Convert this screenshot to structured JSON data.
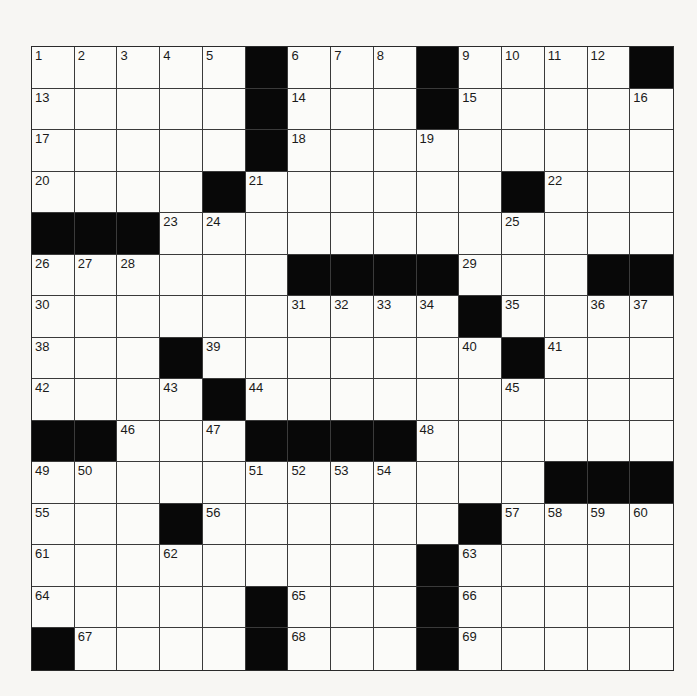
{
  "puzzle": {
    "rows": 15,
    "cols": 15,
    "colors": {
      "block": "#080808",
      "cell": "#fbfbf9",
      "line": "#3a3a3a",
      "page": "#f7f6f3"
    },
    "grid": [
      [
        "1",
        "2",
        "3",
        "4",
        "5",
        "#",
        "6",
        "7",
        "8",
        "#",
        "9",
        "10",
        "11",
        "12",
        "#"
      ],
      [
        "13",
        "",
        "",
        "",
        "",
        "#",
        "14",
        "",
        "",
        "#",
        "15",
        "",
        "",
        "",
        "16"
      ],
      [
        "17",
        "",
        "",
        "",
        "",
        "#",
        "18",
        "",
        "",
        "19",
        "",
        "",
        "",
        "",
        ""
      ],
      [
        "20",
        "",
        "",
        "",
        "#",
        "21",
        "",
        "",
        "",
        "",
        "",
        "#",
        "22",
        "",
        ""
      ],
      [
        "#",
        "#",
        "#",
        "23",
        "24",
        "",
        "",
        "",
        "",
        "",
        "",
        "25",
        "",
        "",
        ""
      ],
      [
        "26",
        "27",
        "28",
        "",
        "",
        "",
        "#",
        "#",
        "#",
        "#",
        "29",
        "",
        "",
        "#",
        "#"
      ],
      [
        "30",
        "",
        "",
        "",
        "",
        "",
        "31",
        "32",
        "33",
        "34",
        "#",
        "35",
        "",
        "36",
        "37"
      ],
      [
        "38",
        "",
        "",
        "#",
        "39",
        "",
        "",
        "",
        "",
        "",
        "40",
        "#",
        "41",
        "",
        ""
      ],
      [
        "42",
        "",
        "",
        "43",
        "#",
        "44",
        "",
        "",
        "",
        "",
        "",
        "45",
        "",
        "",
        ""
      ],
      [
        "#",
        "#",
        "46",
        "",
        "47",
        "#",
        "#",
        "#",
        "#",
        "48",
        "",
        "",
        "",
        "",
        ""
      ],
      [
        "49",
        "50",
        "",
        "",
        "",
        "51",
        "52",
        "53",
        "54",
        "",
        "",
        "",
        "#",
        "#",
        "#"
      ],
      [
        "55",
        "",
        "",
        "#",
        "56",
        "",
        "",
        "",
        "",
        "",
        "#",
        "57",
        "58",
        "59",
        "60"
      ],
      [
        "61",
        "",
        "",
        "62",
        "",
        "",
        "",
        "",
        "",
        "#",
        "63",
        "",
        "",
        "",
        ""
      ],
      [
        "64",
        "",
        "",
        "",
        "",
        "#",
        "65",
        "",
        "",
        "#",
        "66",
        "",
        "",
        "",
        ""
      ],
      [
        "#",
        "67",
        "",
        "",
        "",
        "#",
        "68",
        "",
        "",
        "#",
        "69",
        "",
        "",
        "",
        ""
      ]
    ]
  }
}
